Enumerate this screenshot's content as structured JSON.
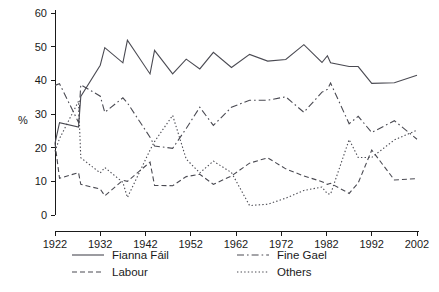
{
  "chart_data": {
    "type": "line",
    "title": "",
    "xlabel": "",
    "ylabel": "%",
    "xlim": [
      1922,
      2002
    ],
    "ylim": [
      0,
      60
    ],
    "grid": false,
    "legend_position": "bottom",
    "x_ticks": [
      "1922",
      "1932",
      "1942",
      "1952",
      "1962",
      "1972",
      "1982",
      "1992",
      "2002"
    ],
    "y_ticks": [
      "0",
      "10",
      "20",
      "30",
      "40",
      "50",
      "60"
    ],
    "x": [
      1922,
      1923,
      1927.2,
      1927.7,
      1932,
      1933,
      1937,
      1938,
      1943,
      1944,
      1948,
      1951,
      1954,
      1957,
      1961,
      1965,
      1969,
      1973,
      1977,
      1981,
      1982.2,
      1982.9,
      1987,
      1989,
      1992,
      1997,
      2002
    ],
    "series": [
      {
        "name": "Fianna Fáil",
        "style": "solid",
        "values": [
          21.3,
          27.4,
          26.1,
          35.2,
          44.5,
          49.7,
          45.2,
          51.9,
          41.9,
          48.9,
          41.9,
          46.3,
          43.4,
          48.3,
          43.8,
          47.7,
          45.7,
          46.2,
          50.6,
          45.3,
          47.3,
          45.2,
          44.1,
          44.1,
          39.1,
          39.3,
          41.5
        ]
      },
      {
        "name": "Fine Gael",
        "style": "dashdot",
        "values": [
          38.5,
          39.0,
          27.5,
          38.7,
          35.3,
          30.5,
          34.8,
          33.3,
          23.1,
          20.5,
          19.8,
          25.7,
          32.0,
          26.6,
          32.0,
          34.1,
          34.1,
          35.1,
          30.5,
          36.5,
          37.3,
          39.2,
          27.1,
          29.3,
          24.5,
          28.0,
          22.5
        ]
      },
      {
        "name": "Labour",
        "style": "dashed",
        "values": [
          21.3,
          10.9,
          12.6,
          9.1,
          7.7,
          5.7,
          10.3,
          10.0,
          15.7,
          8.8,
          8.7,
          11.4,
          12.1,
          9.1,
          11.6,
          15.4,
          17.0,
          13.7,
          11.6,
          9.9,
          9.1,
          9.4,
          6.4,
          9.5,
          19.3,
          10.4,
          10.8
        ]
      },
      {
        "name": "Others",
        "style": "dotted",
        "values": [
          18.9,
          22.7,
          33.8,
          17.0,
          12.5,
          14.1,
          9.7,
          5.2,
          19.3,
          21.8,
          29.6,
          16.6,
          12.5,
          16.0,
          12.6,
          2.8,
          3.2,
          5.0,
          7.3,
          8.3,
          6.3,
          6.2,
          22.4,
          17.1,
          17.1,
          22.3,
          25.2
        ]
      }
    ]
  },
  "axis": {
    "y_label": "%"
  },
  "legend": {
    "entries": [
      {
        "label": "Fianna Fáil",
        "style": "solid"
      },
      {
        "label": "Fine Gael",
        "style": "dashdot"
      },
      {
        "label": "Labour",
        "style": "dashed"
      },
      {
        "label": "Others",
        "style": "dotted"
      }
    ]
  }
}
